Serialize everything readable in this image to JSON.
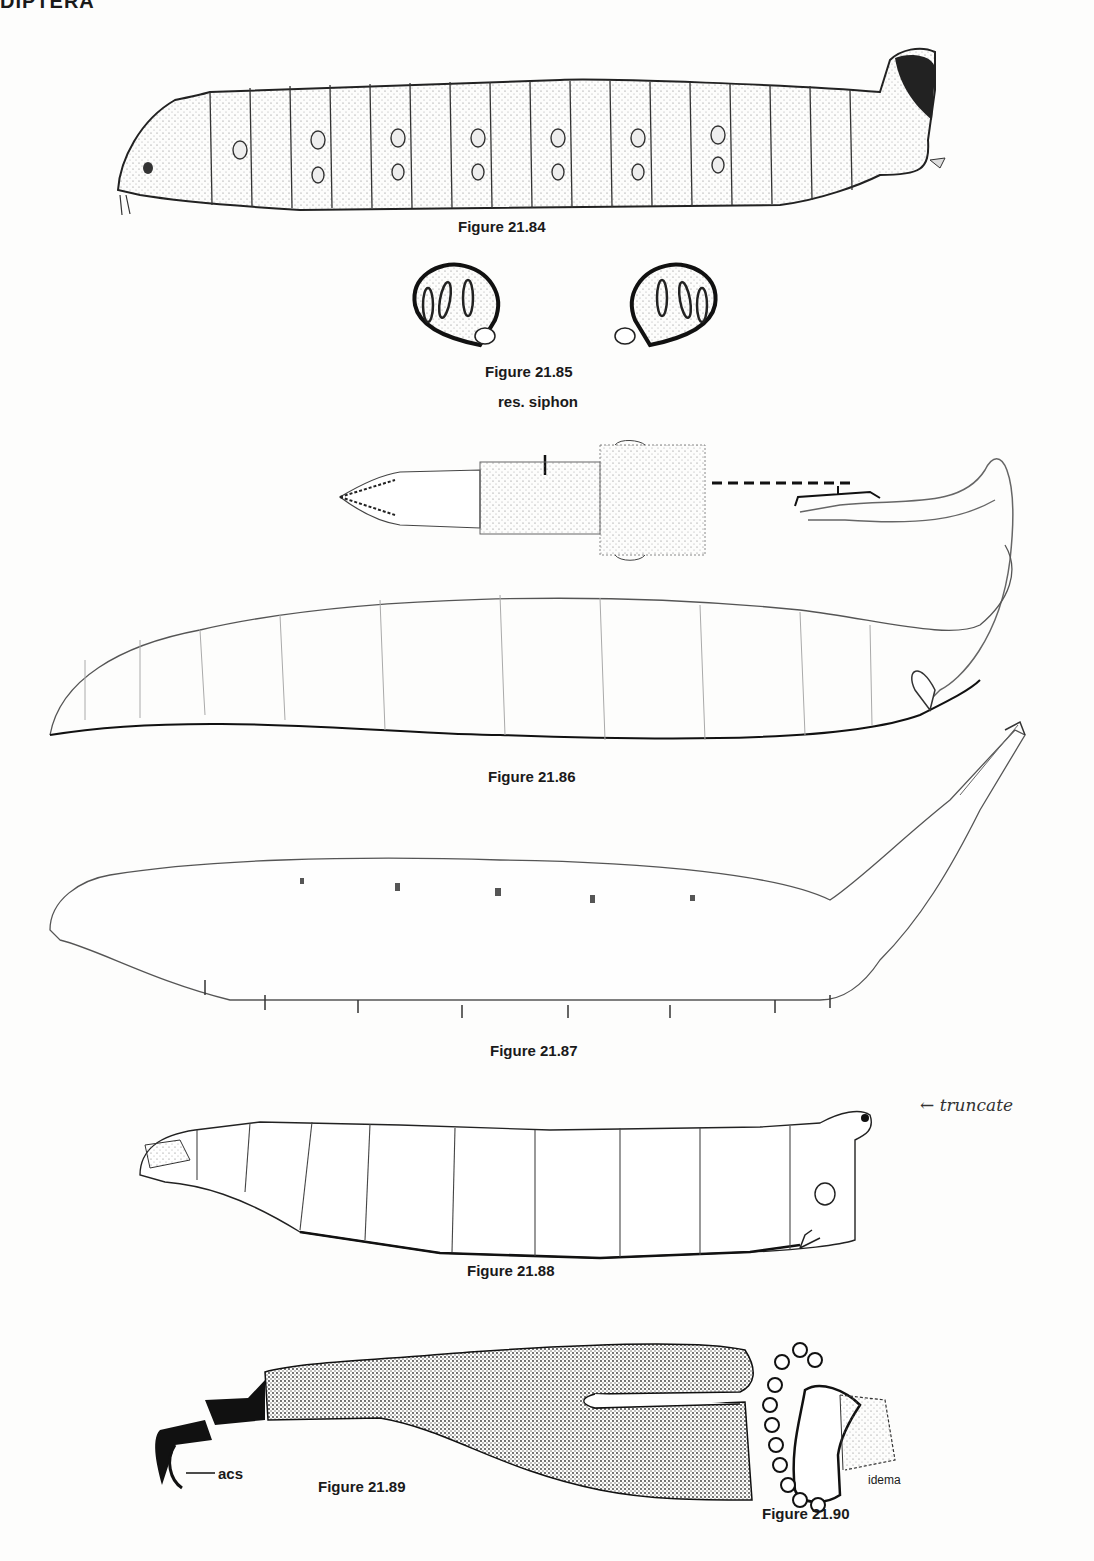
{
  "page": {
    "header": "DIPTERA"
  },
  "figures": [
    {
      "id": "fig-21-84",
      "caption": "Figure 21.84",
      "subject": "larva-lateral-view"
    },
    {
      "id": "fig-21-85",
      "caption": "Figure 21.85",
      "subject": "posterior-spiracles"
    },
    {
      "id": "fig-21-86",
      "caption": "Figure 21.86",
      "subject": "rat-tailed-larva",
      "labels": [
        "res. siphon"
      ]
    },
    {
      "id": "fig-21-87",
      "caption": "Figure 21.87",
      "subject": "larva-with-prolegs"
    },
    {
      "id": "fig-21-88",
      "caption": "Figure 21.88",
      "subject": "larva-lateral-view",
      "annotation": "← truncate"
    },
    {
      "id": "fig-21-89",
      "caption": "Figure 21.89",
      "subject": "mouthhook",
      "labels": [
        "acs"
      ]
    },
    {
      "id": "fig-21-90",
      "caption": "Figure 21.90",
      "subject": "anterior-spiracle",
      "labels": [
        "idema"
      ]
    }
  ]
}
